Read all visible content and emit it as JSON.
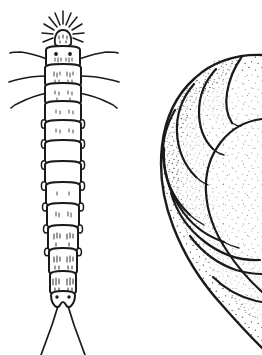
{
  "plate": {
    "title": "Insect larvae — comparative line drawings",
    "background_color": "#ffffff",
    "ink_color": "#1a1a1a",
    "width_px": 262,
    "height_px": 355,
    "medium": "pen-and-ink stipple line drawing",
    "figure_count": 2,
    "caption": "",
    "labels": []
  },
  "figures": [
    {
      "id": "left-larva",
      "name": "elongate-larva-dorsal",
      "description": "Dorsal view of an elongate, strongly segmented campodeiform larva",
      "orientation": "dorsal, head uppermost",
      "fill": "#ffffff",
      "outline_color": "#1a1a1a",
      "shading": "sparse short hatch marks only",
      "bounding_box": {
        "x": 18,
        "y": 14,
        "width": 92,
        "height": 341
      },
      "body_axis_x": 63,
      "head": {
        "name": "head-capsule",
        "center_x": 63,
        "center_y": 30,
        "width": 17,
        "height": 16,
        "antennae_count": 11,
        "note": "small rounded head bearing a fan of radiating setae and antennae"
      },
      "eye_spots": [
        {
          "cx": 56,
          "cy": 54,
          "r": 1.9
        },
        {
          "cx": 70,
          "cy": 54,
          "r": 1.9
        }
      ],
      "lateral_setae": {
        "name": "long-lateral-setae",
        "pairs": 3,
        "side": "both",
        "description": "three pairs of very long, gently curved lateral bristles on the thoracic segments"
      },
      "segments": {
        "count": 12,
        "widest_width": 34,
        "narrowest_width": 20,
        "lateral_nodule_pairs": 8
      },
      "cerci": {
        "name": "terminal-cerci",
        "count": 2,
        "description": "two long, straight, strongly diverging caudal filaments reaching the lower edge of the plate",
        "origin_y": 303,
        "tip_y": 355
      }
    },
    {
      "id": "right-larva",
      "name": "curved-stippled-grub",
      "description": "Large C-shaped scarabaeiform grub, strongly stippled, cropped by the right edge of the plate",
      "orientation": "lateral, curled ventrally",
      "fill": "#ffffff",
      "outline_color": "#1a1a1a",
      "shading": "dense stipple concentrated along segment margins",
      "bounding_box": {
        "x": 160,
        "y": 55,
        "width": 102,
        "height": 300
      },
      "cropped_edges": [
        "right"
      ],
      "segments": {
        "count": 9,
        "lobe_style": "bulging transverse annuli"
      }
    }
  ]
}
